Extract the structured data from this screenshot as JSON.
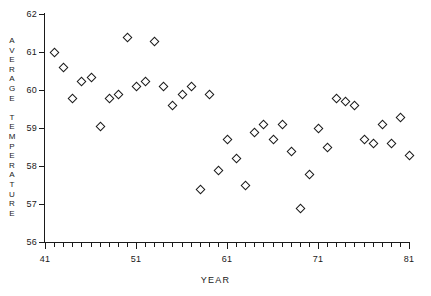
{
  "chart_data": {
    "type": "scatter",
    "title": "",
    "xlabel": "YEAR",
    "ylabel": "AVERAGE TEMPERATURE",
    "ylabel_vertical": "A\nV\nE\nR\nA\nG\nE\n\nT\nE\nM\nP\nE\nR\nA\nT\nU\nR\nE",
    "xlim": [
      41,
      81
    ],
    "ylim": [
      56,
      62
    ],
    "grid": false,
    "legend": null,
    "x_ticks": [
      41,
      51,
      61,
      71,
      81
    ],
    "x_tick_labels": [
      "41",
      "51",
      "61",
      "71",
      "81"
    ],
    "x_minor_tick_step": 1,
    "y_ticks": [
      56,
      57,
      58,
      59,
      60,
      61,
      62
    ],
    "y_tick_labels": [
      "56",
      "57",
      "58",
      "59",
      "60",
      "61",
      "62"
    ],
    "marker": "open-diamond",
    "marker_color": "#1a1a1a",
    "x": [
      42,
      43,
      44,
      45,
      46,
      47,
      48,
      49,
      50,
      51,
      52,
      53,
      54,
      55,
      56,
      57,
      58,
      59,
      60,
      61,
      62,
      63,
      64,
      65,
      66,
      67,
      68,
      69,
      70,
      71,
      72,
      73,
      74,
      75,
      76,
      77,
      78,
      79,
      80,
      81
    ],
    "y": [
      61.0,
      60.6,
      59.8,
      60.25,
      60.35,
      59.05,
      59.8,
      59.9,
      61.4,
      60.1,
      60.25,
      61.3,
      60.1,
      59.6,
      59.9,
      60.1,
      57.4,
      59.9,
      57.9,
      58.7,
      58.2,
      57.5,
      58.9,
      59.1,
      58.7,
      59.1,
      58.4,
      56.9,
      57.8,
      59.0,
      58.5,
      59.8,
      59.7,
      59.6,
      58.7,
      58.6,
      59.1,
      58.6,
      59.3,
      58.3
    ],
    "points": [
      {
        "year": 42,
        "temp": 61.0
      },
      {
        "year": 43,
        "temp": 60.6
      },
      {
        "year": 44,
        "temp": 59.8
      },
      {
        "year": 45,
        "temp": 60.25
      },
      {
        "year": 46,
        "temp": 60.35
      },
      {
        "year": 47,
        "temp": 59.05
      },
      {
        "year": 48,
        "temp": 59.8
      },
      {
        "year": 49,
        "temp": 59.9
      },
      {
        "year": 50,
        "temp": 61.4
      },
      {
        "year": 51,
        "temp": 60.1
      },
      {
        "year": 52,
        "temp": 60.25
      },
      {
        "year": 53,
        "temp": 61.3
      },
      {
        "year": 54,
        "temp": 60.1
      },
      {
        "year": 55,
        "temp": 59.6
      },
      {
        "year": 56,
        "temp": 59.9
      },
      {
        "year": 57,
        "temp": 60.1
      },
      {
        "year": 58,
        "temp": 57.4
      },
      {
        "year": 59,
        "temp": 59.9
      },
      {
        "year": 60,
        "temp": 57.9
      },
      {
        "year": 61,
        "temp": 58.7
      },
      {
        "year": 62,
        "temp": 58.2
      },
      {
        "year": 63,
        "temp": 57.5
      },
      {
        "year": 64,
        "temp": 58.9
      },
      {
        "year": 65,
        "temp": 59.1
      },
      {
        "year": 66,
        "temp": 58.7
      },
      {
        "year": 67,
        "temp": 59.1
      },
      {
        "year": 68,
        "temp": 58.4
      },
      {
        "year": 69,
        "temp": 56.9
      },
      {
        "year": 70,
        "temp": 57.8
      },
      {
        "year": 71,
        "temp": 59.0
      },
      {
        "year": 72,
        "temp": 58.5
      },
      {
        "year": 73,
        "temp": 59.8
      },
      {
        "year": 74,
        "temp": 59.7
      },
      {
        "year": 75,
        "temp": 59.6
      },
      {
        "year": 76,
        "temp": 58.7
      },
      {
        "year": 77,
        "temp": 58.6
      },
      {
        "year": 78,
        "temp": 59.1
      },
      {
        "year": 79,
        "temp": 58.6
      },
      {
        "year": 80,
        "temp": 59.3
      },
      {
        "year": 81,
        "temp": 58.3
      }
    ]
  }
}
